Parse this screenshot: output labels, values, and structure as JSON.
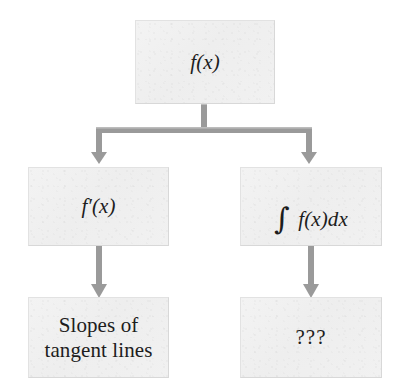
{
  "diagram": {
    "type": "flowchart",
    "title": "",
    "orientation": "top-down",
    "colors": {
      "background": "#ffffff",
      "node_fill": "#f0f0f0",
      "node_border": "#e2e2e2",
      "connector": "#9a9a9a",
      "text": "#1d1d1d"
    },
    "nodes": [
      {
        "id": "root",
        "label": "f(x)",
        "label_parts": {
          "func": "f",
          "open": "(",
          "var": "x",
          "close": ")"
        },
        "style": "math-italic",
        "row": 0,
        "column": "center"
      },
      {
        "id": "derivative",
        "label": "f′(x)",
        "label_parts": {
          "func": "f",
          "prime": "′",
          "open": "(",
          "var": "x",
          "close": ")"
        },
        "style": "math-italic",
        "row": 1,
        "column": "left"
      },
      {
        "id": "integral",
        "label": "∫ f(x)dx",
        "label_parts": {
          "integral": "∫",
          "func": "f",
          "open": "(",
          "var": "x",
          "close": ")",
          "differential": "dx"
        },
        "style": "math-italic",
        "row": 1,
        "column": "right"
      },
      {
        "id": "slopes",
        "label": "Slopes of\ntangent lines",
        "line1": "Slopes of",
        "line2": "tangent lines",
        "style": "plain-roman",
        "row": 2,
        "column": "left"
      },
      {
        "id": "unknown",
        "label": "???",
        "style": "plain-roman",
        "row": 2,
        "column": "right"
      }
    ],
    "edges": [
      {
        "id": "root-to-branch",
        "from": "root",
        "to": "branch-point",
        "arrowhead": false
      },
      {
        "id": "branch-to-derivative",
        "from": "root",
        "to": "derivative",
        "arrowhead": true
      },
      {
        "id": "branch-to-integral",
        "from": "root",
        "to": "integral",
        "arrowhead": true
      },
      {
        "id": "derivative-to-slopes",
        "from": "derivative",
        "to": "slopes",
        "arrowhead": true
      },
      {
        "id": "integral-to-unknown",
        "from": "integral",
        "to": "unknown",
        "arrowhead": true
      }
    ]
  }
}
